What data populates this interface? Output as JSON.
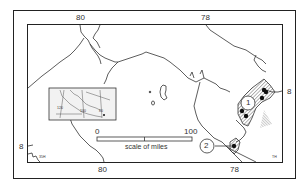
{
  "map": {
    "axis_labels": {
      "top": [
        {
          "text": "80"
        },
        {
          "text": "78"
        }
      ],
      "bottom": [
        {
          "text": "80"
        },
        {
          "text": "78"
        }
      ],
      "left": [
        {
          "text": "8"
        }
      ],
      "right": [
        {
          "text": "8"
        }
      ]
    },
    "scale_bar": {
      "start": "0",
      "end": "100",
      "caption": "scale of miles"
    },
    "sites": [
      {
        "label": "1"
      },
      {
        "label": "2"
      }
    ],
    "inset": {
      "labels": [
        "120",
        "100",
        "80"
      ]
    },
    "corner_marks": {
      "bottom_left": "35H",
      "bottom_right": "TH"
    },
    "colors": {
      "line": "#333333",
      "frame": "#222222",
      "background": "#ffffff"
    }
  }
}
